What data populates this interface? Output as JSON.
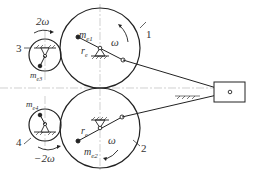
{
  "diagram": {
    "type": "mechanism-schematic",
    "colors": {
      "stroke": "#222222",
      "centerline": "#bbbbbb",
      "background": "#ffffff"
    },
    "gears": [
      {
        "id": "1",
        "label": "1",
        "mass_label": "m",
        "mass_sub": "e1",
        "radius_label": "r",
        "radius_sub": "e",
        "speed": "ω"
      },
      {
        "id": "2",
        "label": "2",
        "mass_label": "m",
        "mass_sub": "e2",
        "radius_label": "r",
        "radius_sub": "e",
        "speed": "ω"
      },
      {
        "id": "3",
        "label": "3",
        "mass_label": "m",
        "mass_sub": "e3",
        "speed": "2ω"
      },
      {
        "id": "4",
        "label": "4",
        "mass_label": "m",
        "mass_sub": "e4",
        "speed": "−2ω"
      }
    ],
    "slider": {
      "label": "slider"
    }
  }
}
